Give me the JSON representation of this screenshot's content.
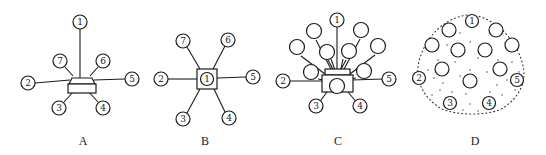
{
  "figure": {
    "panels": [
      {
        "label": "A",
        "description": "Trapezoid-topped central box with numbered stations connected by lines",
        "nodes": [
          "1",
          "2",
          "3",
          "4",
          "5",
          "6",
          "7"
        ]
      },
      {
        "label": "B",
        "description": "Square central hub containing station 1 with six radial stations",
        "hub": "1",
        "nodes": [
          "2",
          "3",
          "4",
          "5",
          "6",
          "7"
        ]
      },
      {
        "label": "C",
        "description": "Central box with many radial stations, numbered and unnumbered",
        "nodes": [
          "1",
          "2",
          "3",
          "4",
          "5"
        ],
        "unnumbered_count": 10
      },
      {
        "label": "D",
        "description": "Dotted oval enclosing numbered perimeter stations and unnumbered circles",
        "nodes": [
          "1",
          "2",
          "3",
          "4",
          "5"
        ],
        "unnumbered_count": 12
      }
    ]
  },
  "colors": {
    "line": "#1a1a1a",
    "background": "#ffffff"
  }
}
